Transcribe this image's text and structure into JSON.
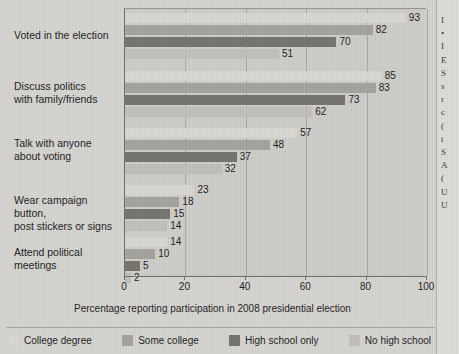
{
  "chart_data": {
    "type": "bar",
    "orientation": "horizontal",
    "title": "",
    "xlabel": "Percentage reporting participation in 2008 presidential election",
    "ylabel": "",
    "xlim": [
      0,
      100
    ],
    "xticks": [
      0,
      20,
      40,
      60,
      80,
      100
    ],
    "xtick_labels": [
      "0",
      "20",
      "40",
      "60",
      "80",
      "100"
    ],
    "grid": true,
    "grid_axis": "x",
    "legend_position": "bottom",
    "categories": [
      "Voted in the election",
      "Discuss politics with family/friends",
      "Talk with anyone about voting",
      "Wear campaign button, post stickers or signs",
      "Attend political meetings"
    ],
    "category_lines": [
      [
        "Voted in the election"
      ],
      [
        "Discuss politics",
        "with family/friends"
      ],
      [
        "Talk with anyone",
        "about voting"
      ],
      [
        "Wear campaign button,",
        "post stickers or signs"
      ],
      [
        "Attend political",
        "meetings"
      ]
    ],
    "series": [
      {
        "name": "College degree",
        "color": "#d9d7d2",
        "values": [
          93,
          85,
          57,
          23,
          14
        ]
      },
      {
        "name": "Some college",
        "color": "#a5a39e",
        "values": [
          82,
          83,
          48,
          18,
          10
        ]
      },
      {
        "name": "High school only",
        "color": "#76746f",
        "values": [
          70,
          73,
          37,
          15,
          5
        ]
      },
      {
        "name": "No high school",
        "color": "#c2c0bb",
        "values": [
          51,
          62,
          32,
          14,
          2
        ]
      }
    ]
  },
  "legend": {
    "items": [
      {
        "label": "College degree",
        "color": "#d9d7d2"
      },
      {
        "label": "Some college",
        "color": "#a5a39e"
      },
      {
        "label": "High school only",
        "color": "#76746f"
      },
      {
        "label": "No high school",
        "color": "#c2c0bb"
      }
    ]
  },
  "page": {
    "background_color": "#d6d4d0",
    "plot_background_color": "#cfcdc9",
    "axis_color": "#6f6d6a",
    "text_color": "#1d1d1d"
  },
  "right_column": {
    "visible": true,
    "fragments": [
      "I",
      "•",
      "I",
      "E",
      "S",
      "s",
      "r",
      "c",
      "(",
      "t",
      "S",
      "A",
      "(",
      "U",
      "U"
    ]
  }
}
